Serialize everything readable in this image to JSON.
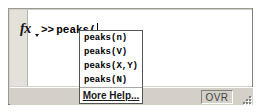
{
  "window": {
    "name": "command-window",
    "background_color": "#d4d0c8"
  },
  "editor": {
    "fx_icon": "fx-icon",
    "fx_caret_icon": "chevron-down-icon",
    "prompt_symbol": ">>",
    "command_text": "peaks(",
    "caret_visible": true
  },
  "autocomplete": {
    "items": [
      {
        "label": "peaks(n)"
      },
      {
        "label": "peaks(V)"
      },
      {
        "label": "peaks(X,Y)"
      },
      {
        "label": "peaks(N)"
      }
    ],
    "more_help_label": "More Help...",
    "border_color": "#555555",
    "background_color": "#ffffff"
  },
  "statusbar": {
    "overwrite_mode_label": "OVR",
    "resize_grip_icon": "resize-grip-icon"
  }
}
